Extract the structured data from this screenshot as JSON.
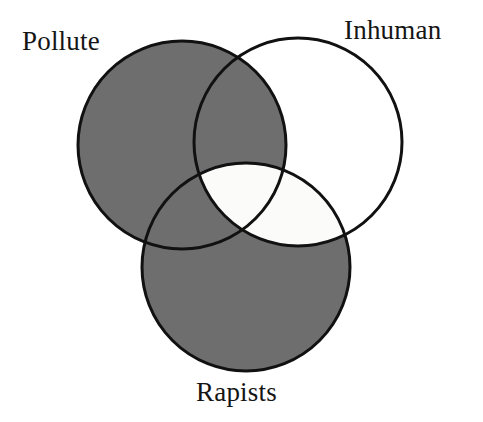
{
  "diagram": {
    "type": "venn",
    "title": "",
    "background_color": "#ffffff",
    "stroke_color": "#111111",
    "stroke_width": 3,
    "fill_gray": "#6e6e6e",
    "fill_white": "#fbfbfa",
    "sets": [
      {
        "id": "pollute",
        "label": "Pollute",
        "cx": 182,
        "cy": 145,
        "r": 104,
        "fill": "#6e6e6e",
        "label_x": 22,
        "label_y": 28
      },
      {
        "id": "inhuman",
        "label": "Inhuman",
        "cx": 298,
        "cy": 142,
        "r": 104,
        "fill": "#ffffff",
        "label_x": 344,
        "label_y": 17
      },
      {
        "id": "rapists",
        "label": "Rapists",
        "cx": 246,
        "cy": 267,
        "r": 104,
        "fill": "#6e6e6e",
        "label_x": 196,
        "label_y": 379
      }
    ],
    "regions": [
      {
        "id": "pollute-only",
        "members": [
          "pollute"
        ],
        "shade": "gray"
      },
      {
        "id": "inhuman-only",
        "members": [
          "inhuman"
        ],
        "shade": "white"
      },
      {
        "id": "rapists-only",
        "members": [
          "rapists"
        ],
        "shade": "gray"
      },
      {
        "id": "pollute-inhuman",
        "members": [
          "pollute",
          "inhuman"
        ],
        "shade": "gray"
      },
      {
        "id": "pollute-rapists",
        "members": [
          "pollute",
          "rapists"
        ],
        "shade": "gray"
      },
      {
        "id": "inhuman-rapists",
        "members": [
          "inhuman",
          "rapists"
        ],
        "shade": "white"
      },
      {
        "id": "all-three",
        "members": [
          "pollute",
          "inhuman",
          "rapists"
        ],
        "shade": "white"
      }
    ]
  }
}
